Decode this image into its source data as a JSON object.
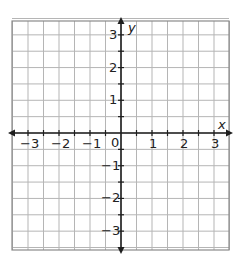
{
  "chart_data": {
    "type": "coordinate-grid",
    "title": "",
    "xlabel": "x",
    "ylabel": "y",
    "xlim": [
      -3.5,
      3.5
    ],
    "ylim": [
      -3.5,
      3.5
    ],
    "grid": true,
    "grid_step": 0.5,
    "x_ticks": [
      -3,
      -2,
      -1,
      0,
      1,
      2,
      3
    ],
    "y_ticks": [
      3,
      2,
      1,
      -1,
      -2,
      -3
    ],
    "x_tick_labels": [
      "−3",
      "−2",
      "−1",
      "0",
      "1",
      "2",
      "3"
    ],
    "y_tick_labels": [
      "3",
      "2",
      "1",
      "−1",
      "−2",
      "−3"
    ],
    "origin_label": "0",
    "series": []
  },
  "colors": {
    "grid": "#b5b5b5",
    "border": "#8a8a8a",
    "axis": "#1e1e1e",
    "text": "#222222"
  }
}
